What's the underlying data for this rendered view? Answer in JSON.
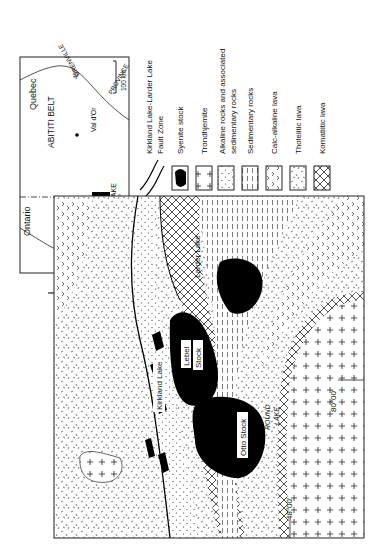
{
  "inset": {
    "labels": {
      "quebec": "Quebec",
      "ontario": "Ontario",
      "abitibi": "ABITITI BELT",
      "grenville1": "GRENVILLE",
      "grenville2": "PROVINCE",
      "kapuskasing1": "KAPUSKASING",
      "kapuskasing2": "GNEISS BELT",
      "valdor": "Val d'Or",
      "timmins": "Timmins",
      "kirkland": "KIRKLAND LAKE",
      "lat49": "49°",
      "lon80": "80°",
      "scale": "100 km"
    }
  },
  "north_arrow": {
    "label": "N"
  },
  "legend": {
    "items": [
      {
        "id": "fault",
        "label": "Kirkland Lake-Larder Lake",
        "label2": "Fault Zone"
      },
      {
        "id": "syenite",
        "label": "Syenite stock"
      },
      {
        "id": "trondhjemite",
        "label": "Trondhjemite"
      },
      {
        "id": "alkaline",
        "label": "Alkaline rocks and associated",
        "label2": "sedimentary rocks"
      },
      {
        "id": "sedimentary",
        "label": "Sedimentary rocks"
      },
      {
        "id": "calcalkaline",
        "label": "Calc-alkaline lava"
      },
      {
        "id": "tholeiitic",
        "label": "Tholeiitic lava"
      },
      {
        "id": "komatiitic",
        "label": "Komatiitic lava"
      }
    ]
  },
  "map": {
    "labels": {
      "kirkland_lake": "Kirkland Lake",
      "larder_lake": "Larder Lake",
      "lebel": "Lebel",
      "stock": "Stock",
      "otto": "Otto Stock",
      "round": "ROUND",
      "lake": "LAKE",
      "lon": "80°00'",
      "lat": "48°00'"
    }
  }
}
